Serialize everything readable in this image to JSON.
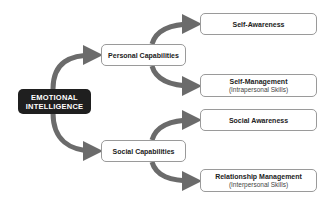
{
  "diagram": {
    "type": "concept-map",
    "colors": {
      "root_fill": "#1f1f1f",
      "root_text": "#ffffff",
      "arrow": "#6b6b6b",
      "box_border": "#9a9a9a",
      "box_fill": "#ffffff"
    },
    "root": {
      "line1": "EMOTIONAL",
      "line2": "INTELLIGENCE"
    },
    "branches": [
      {
        "label": "Personal Capabilities",
        "children": [
          {
            "title": "Self-Awareness",
            "subtitle": ""
          },
          {
            "title": "Self-Management",
            "subtitle": "(Intrapersonal Skills)"
          }
        ]
      },
      {
        "label": "Social Capabilities",
        "children": [
          {
            "title": "Social Awareness",
            "subtitle": ""
          },
          {
            "title": "Relationship Management",
            "subtitle": "(Interpersonal Skills)"
          }
        ]
      }
    ]
  }
}
